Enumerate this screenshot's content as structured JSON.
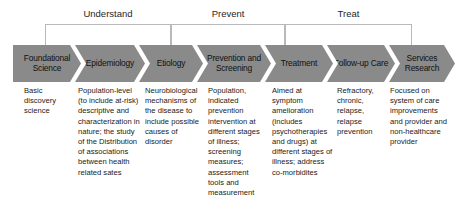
{
  "diagram": {
    "chevron_color": "#8a8a8a",
    "bracket_color": "#b9b9b9",
    "phases": [
      {
        "label": "Understand",
        "left": 45,
        "width": 126
      },
      {
        "label": "Prevent",
        "left": 171,
        "width": 114
      },
      {
        "label": "Treat",
        "left": 285,
        "width": 127
      }
    ],
    "stages": [
      {
        "name": "foundational-science",
        "label": "Foundational Science",
        "description": "Basic discovery science",
        "chev_left": 0,
        "chev_width": 68,
        "desc_left": 24,
        "desc_width": 48
      },
      {
        "name": "epidemiology",
        "label": "Epidemiology",
        "description": "Population-level (to include at-risk) descriptive and characterization in nature; the study of the Distribution of associations between health related sates",
        "chev_left": 62,
        "chev_width": 70,
        "desc_left": 78,
        "desc_width": 62
      },
      {
        "name": "etiology",
        "label": "Etiology",
        "description": "Neurobiological mechanisms of the disease to include possible causes of disorder",
        "chev_left": 126,
        "chev_width": 64,
        "desc_left": 145,
        "desc_width": 58
      },
      {
        "name": "prevention-and-screening",
        "label": "Prevention and Screening",
        "description": "Population, indicated prevention intervention at different stages of illness; screening measures; assessment tools and measurement",
        "chev_left": 184,
        "chev_width": 74,
        "desc_left": 208,
        "desc_width": 57
      },
      {
        "name": "treatment",
        "label": "Treatment",
        "description": "Aimed at symptom amelioration (includes psychotherapies and drugs) at different stages of illness; address co-morbidites",
        "chev_left": 252,
        "chev_width": 68,
        "desc_left": 272,
        "desc_width": 61
      },
      {
        "name": "follow-up-care",
        "label": "Follow-up Care",
        "description": "Refractory, chronic, relapse, relapse prevention",
        "chev_left": 314,
        "chev_width": 68,
        "desc_left": 337,
        "desc_width": 46
      },
      {
        "name": "services-research",
        "label": "Services Research",
        "description": "Focused on system of care improvements and provider and non-healthcare provider",
        "chev_left": 376,
        "chev_width": 66,
        "desc_left": 390,
        "desc_width": 58
      }
    ]
  }
}
